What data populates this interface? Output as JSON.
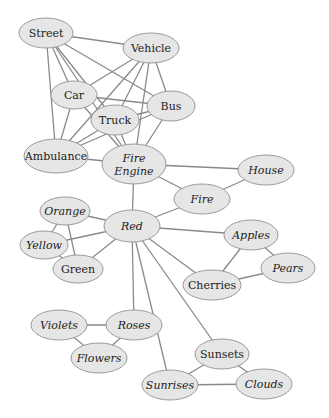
{
  "diagram": {
    "title": "",
    "type": "semantic-network",
    "colors": {
      "node_fill": "#e6e6e6",
      "node_stroke": "#9a9a9a",
      "edge": "#8a8a8a",
      "text": "#222222",
      "background": "#ffffff"
    },
    "nodes": [
      {
        "id": "street",
        "label": "Street",
        "x": 46,
        "y": 33,
        "rx": 27,
        "ry": 15,
        "italic": false
      },
      {
        "id": "vehicle",
        "label": "Vehicle",
        "x": 151,
        "y": 48,
        "rx": 28,
        "ry": 15,
        "italic": false
      },
      {
        "id": "car",
        "label": "Car",
        "x": 74,
        "y": 95,
        "rx": 23,
        "ry": 14,
        "italic": false
      },
      {
        "id": "bus",
        "label": "Bus",
        "x": 171,
        "y": 106,
        "rx": 24,
        "ry": 15,
        "italic": false
      },
      {
        "id": "truck",
        "label": "Truck",
        "x": 115,
        "y": 120,
        "rx": 24,
        "ry": 15,
        "italic": false
      },
      {
        "id": "ambulance",
        "label": "Ambulance",
        "x": 56,
        "y": 156,
        "rx": 32,
        "ry": 17,
        "italic": false
      },
      {
        "id": "fire-engine",
        "label1": "Fire",
        "label2": "Engine",
        "x": 134,
        "y": 164,
        "rx": 32,
        "ry": 20,
        "italic": true
      },
      {
        "id": "house",
        "label": "House",
        "x": 266,
        "y": 170,
        "rx": 28,
        "ry": 15,
        "italic": true
      },
      {
        "id": "fire",
        "label": "Fire",
        "x": 202,
        "y": 199,
        "rx": 28,
        "ry": 15,
        "italic": true
      },
      {
        "id": "orange",
        "label": "Orange",
        "x": 65,
        "y": 211,
        "rx": 25,
        "ry": 14,
        "italic": true
      },
      {
        "id": "red",
        "label": "Red",
        "x": 132,
        "y": 226,
        "rx": 28,
        "ry": 16,
        "italic": true
      },
      {
        "id": "yellow",
        "label": "Yellow",
        "x": 44,
        "y": 245,
        "rx": 24,
        "ry": 14,
        "italic": true
      },
      {
        "id": "apples",
        "label": "Apples",
        "x": 251,
        "y": 235,
        "rx": 27,
        "ry": 15,
        "italic": true
      },
      {
        "id": "green",
        "label": "Green",
        "x": 78,
        "y": 269,
        "rx": 25,
        "ry": 14,
        "italic": false
      },
      {
        "id": "pears",
        "label": "Pears",
        "x": 288,
        "y": 268,
        "rx": 27,
        "ry": 15,
        "italic": true
      },
      {
        "id": "cherries",
        "label": "Cherries",
        "x": 212,
        "y": 285,
        "rx": 29,
        "ry": 15,
        "italic": false
      },
      {
        "id": "violets",
        "label": "Violets",
        "x": 59,
        "y": 325,
        "rx": 28,
        "ry": 15,
        "italic": true
      },
      {
        "id": "roses",
        "label": "Roses",
        "x": 134,
        "y": 325,
        "rx": 28,
        "ry": 15,
        "italic": true
      },
      {
        "id": "flowers",
        "label": "Flowers",
        "x": 99,
        "y": 358,
        "rx": 28,
        "ry": 15,
        "italic": true
      },
      {
        "id": "sunsets",
        "label": "Sunsets",
        "x": 222,
        "y": 354,
        "rx": 27,
        "ry": 15,
        "italic": false
      },
      {
        "id": "sunrises",
        "label": "Sunrises",
        "x": 170,
        "y": 385,
        "rx": 28,
        "ry": 15,
        "italic": true
      },
      {
        "id": "clouds",
        "label": "Clouds",
        "x": 264,
        "y": 384,
        "rx": 28,
        "ry": 15,
        "italic": true
      }
    ],
    "edges": [
      [
        "street",
        "vehicle"
      ],
      [
        "street",
        "car"
      ],
      [
        "street",
        "bus"
      ],
      [
        "street",
        "truck"
      ],
      [
        "street",
        "ambulance"
      ],
      [
        "street",
        "fire-engine"
      ],
      [
        "vehicle",
        "car"
      ],
      [
        "vehicle",
        "bus"
      ],
      [
        "vehicle",
        "truck"
      ],
      [
        "vehicle",
        "ambulance"
      ],
      [
        "vehicle",
        "fire-engine"
      ],
      [
        "car",
        "bus"
      ],
      [
        "car",
        "ambulance"
      ],
      [
        "car",
        "fire-engine"
      ],
      [
        "truck",
        "bus"
      ],
      [
        "truck",
        "fire-engine"
      ],
      [
        "truck",
        "ambulance"
      ],
      [
        "bus",
        "ambulance"
      ],
      [
        "bus",
        "fire-engine"
      ],
      [
        "ambulance",
        "fire-engine"
      ],
      [
        "fire-engine",
        "house"
      ],
      [
        "fire-engine",
        "fire"
      ],
      [
        "fire-engine",
        "red"
      ],
      [
        "house",
        "fire"
      ],
      [
        "red",
        "fire"
      ],
      [
        "red",
        "orange"
      ],
      [
        "red",
        "yellow"
      ],
      [
        "red",
        "green"
      ],
      [
        "red",
        "apples"
      ],
      [
        "red",
        "cherries"
      ],
      [
        "red",
        "roses"
      ],
      [
        "red",
        "sunsets"
      ],
      [
        "red",
        "sunrises"
      ],
      [
        "orange",
        "yellow"
      ],
      [
        "orange",
        "green"
      ],
      [
        "yellow",
        "green"
      ],
      [
        "apples",
        "cherries"
      ],
      [
        "apples",
        "pears"
      ],
      [
        "cherries",
        "pears"
      ],
      [
        "violets",
        "roses"
      ],
      [
        "violets",
        "flowers"
      ],
      [
        "roses",
        "flowers"
      ],
      [
        "sunsets",
        "sunrises"
      ],
      [
        "sunsets",
        "clouds"
      ],
      [
        "sunrises",
        "clouds"
      ]
    ]
  },
  "caption": {
    "text": "2.3  . . .  . . .  . .  . ."
  }
}
